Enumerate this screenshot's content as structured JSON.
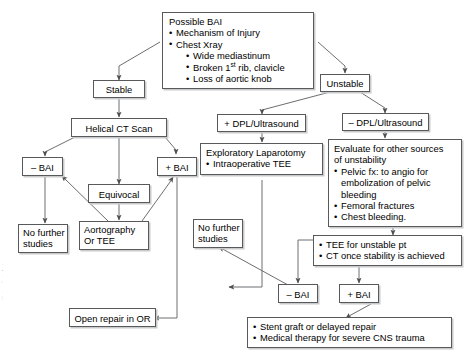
{
  "diagram": {
    "nodes": {
      "possible_bai": {
        "heading": "Possible BAI",
        "bullets": [
          "Mechanism of Injury",
          "Chest Xray"
        ],
        "subbullets": [
          "Wide mediastinum",
          "Broken 1st rib, clavicle",
          "Loss of aortic knob"
        ],
        "sub_rib_pre": "Broken 1",
        "sub_rib_sup": "st",
        "sub_rib_post": " rib, clavicle"
      },
      "stable": {
        "label": "Stable"
      },
      "unstable": {
        "label": "Unstable"
      },
      "helical_ct": {
        "label": "Helical CT Scan"
      },
      "bai_neg_left": {
        "label": "– BAI"
      },
      "equivocal": {
        "label": "Equivocal"
      },
      "bai_pos_left": {
        "label": "+ BAI"
      },
      "no_further_studies_left": {
        "line1": "No further",
        "line2": "studies"
      },
      "aortography": {
        "line1": "Aortography",
        "line2": "Or TEE"
      },
      "open_repair": {
        "label": "Open repair in OR"
      },
      "dpl_positive": {
        "label": "+ DPL/Ultrasound"
      },
      "dpl_negative": {
        "label": "– DPL/Ultrasound"
      },
      "exploratory_lap": {
        "heading": "Exploratory Laparotomy",
        "bullets": [
          "Intraoperative TEE"
        ]
      },
      "no_further_studies_mid": {
        "line1": "No further",
        "line2": "studies"
      },
      "evaluate_unstability": {
        "heading_line1": "Evaluate for other sources",
        "heading_line2": "of unstability",
        "bullets": [
          "Pelvic fx: to angio for embolization of pelvic bleeding",
          "Femoral fractures",
          "Chest bleeding."
        ]
      },
      "tee_ct": {
        "bullets": [
          "TEE for unstable pt",
          "CT once stability is achieved"
        ]
      },
      "bai_neg_bottom": {
        "label": "– BAI"
      },
      "bai_pos_bottom": {
        "label": "+ BAI"
      },
      "treatment": {
        "bullets": [
          "Stent graft or delayed repair",
          "Medical therapy for severe CNS trauma"
        ]
      }
    },
    "colors": {
      "border": "#58595b",
      "shadow": "#c9cacc",
      "text": "#000000",
      "background": "#ffffff",
      "edge": "#6d6e71"
    }
  }
}
